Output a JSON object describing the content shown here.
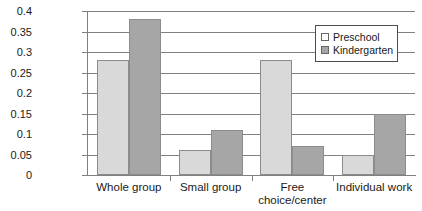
{
  "chart_data": {
    "type": "bar",
    "title": "",
    "xlabel": "",
    "ylabel": "",
    "ylim": [
      0,
      0.4
    ],
    "grid": true,
    "legend_position": "top-right",
    "categories": [
      "Whole group",
      "Small group",
      "Free\nchoice/center",
      "Individual work"
    ],
    "y_ticks": [
      "0",
      "0.05",
      "0.1",
      "0.15",
      "0.2",
      "0.25",
      "0.3",
      "0.35",
      "0.4"
    ],
    "y_tick_values": [
      0,
      0.05,
      0.1,
      0.15,
      0.2,
      0.25,
      0.3,
      0.35,
      0.4
    ],
    "series": [
      {
        "name": "Preschool",
        "color": "#d9d9d9",
        "values": [
          0.28,
          0.06,
          0.28,
          0.05
        ]
      },
      {
        "name": "Kindergarten",
        "color": "#a6a6a6",
        "values": [
          0.38,
          0.11,
          0.07,
          0.15
        ]
      }
    ]
  },
  "legend": {
    "items": [
      {
        "label": "Preschool",
        "swatch": "legend-swatch-preschool"
      },
      {
        "label": "Kindergarten",
        "swatch": "legend-swatch-kindergarten"
      }
    ]
  },
  "colors": {
    "preschool": "#d9d9d9",
    "kindergarten": "#a6a6a6",
    "axis": "#808080",
    "grid": "#808080",
    "text": "#1a1a1a",
    "background": "#ffffff"
  }
}
